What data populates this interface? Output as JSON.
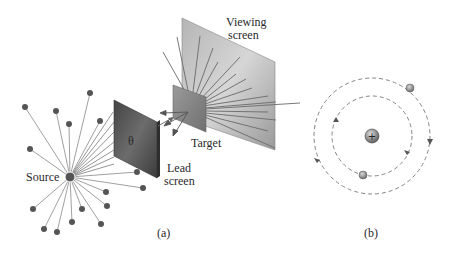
{
  "panel_a": {
    "caption": "(a)",
    "labels": {
      "source": "Source",
      "lead_screen_line1": "Lead",
      "lead_screen_line2": "screen",
      "target": "Target",
      "viewing_screen_line1": "Viewing",
      "viewing_screen_line2": "screen",
      "theta": "θ"
    }
  },
  "panel_b": {
    "caption": "(b)",
    "nucleus_symbol": "+"
  },
  "colors": {
    "ray": "#7a7a7a",
    "dot": "#555555",
    "lead_screen": "#5a5a5a",
    "target": "#8a8a8a",
    "viewing_screen": "#a9a9a9",
    "orbit": "#777777",
    "text": "#2a2a2a"
  }
}
